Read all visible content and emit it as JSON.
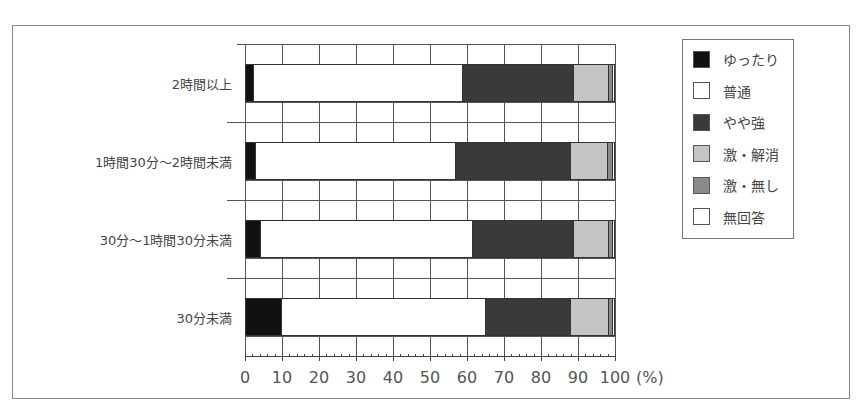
{
  "chart_data": {
    "type": "bar",
    "orientation": "horizontal",
    "stacked": true,
    "normalized": true,
    "title": "",
    "xlabel": "(%)",
    "ylabel": "",
    "xlim": [
      0,
      100
    ],
    "x_ticks": [
      0,
      10,
      20,
      30,
      40,
      50,
      60,
      70,
      80,
      90,
      100
    ],
    "grid": true,
    "legend_position": "right",
    "categories": [
      "2時間以上",
      "1時間30分～2時間未満",
      "30分～1時間30分未満",
      "30分未満"
    ],
    "series": [
      {
        "name": "ゆったり",
        "color": "#111111",
        "values": [
          2.5,
          3.0,
          4.3,
          10.0
        ]
      },
      {
        "name": "普通",
        "color": "#ffffff",
        "values": [
          56.5,
          54.0,
          57.2,
          55.0
        ]
      },
      {
        "name": "やや強",
        "color": "#3a3a3a",
        "values": [
          30.0,
          31.0,
          27.5,
          23.0
        ]
      },
      {
        "name": "激・解消",
        "color": "#c4c4c4",
        "values": [
          9.5,
          10.0,
          9.5,
          10.5
        ]
      },
      {
        "name": "激・無し",
        "color": "#8a8a8a",
        "values": [
          1.0,
          1.5,
          1.0,
          1.0
        ]
      },
      {
        "name": "無回答",
        "color": "#ffffff",
        "values": [
          0.5,
          0.5,
          0.5,
          0.5
        ]
      }
    ]
  },
  "axis": {
    "ticks": [
      "0",
      "10",
      "20",
      "30",
      "40",
      "50",
      "60",
      "70",
      "80",
      "90",
      "100"
    ],
    "unit": "(%)"
  },
  "legend": {
    "items": [
      {
        "label": "ゆったり",
        "color": "#111111"
      },
      {
        "label": "普通",
        "color": "#ffffff"
      },
      {
        "label": "やや強",
        "color": "#3a3a3a"
      },
      {
        "label": "激・解消",
        "color": "#c4c4c4"
      },
      {
        "label": "激・無し",
        "color": "#8a8a8a"
      },
      {
        "label": "無回答",
        "color": "#ffffff"
      }
    ]
  }
}
